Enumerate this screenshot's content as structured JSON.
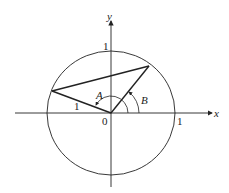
{
  "diagram": {
    "type": "unit-circle-angle-difference",
    "axes": {
      "x_label": "x",
      "y_label": "y"
    },
    "tick_labels": {
      "y_one": "1",
      "x_one": "1",
      "origin": "0"
    },
    "segment_label": "1",
    "angles": {
      "A": "A",
      "B": "B"
    },
    "colors": {
      "stroke": "#222222",
      "background": "#ffffff"
    }
  }
}
